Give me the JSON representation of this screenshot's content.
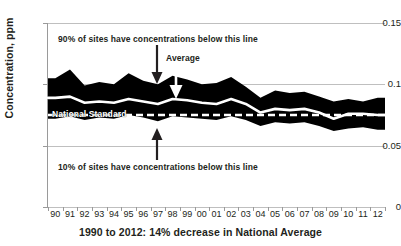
{
  "top_ghost_text": "",
  "chart_data": {
    "type": "area",
    "title": "",
    "xlabel": "1990 to 2012: 14% decrease in National Average",
    "ylabel": "Concentration, ppm",
    "ylim": [
      0,
      0.15
    ],
    "yticks": [
      "0",
      "0.05",
      "0.1",
      "0.15"
    ],
    "ytick_values": [
      0,
      0.05,
      0.1,
      0.15
    ],
    "grid": true,
    "legend": "none",
    "categories": [
      "90",
      "91",
      "92",
      "93",
      "94",
      "95",
      "96",
      "97",
      "98",
      "99",
      "00",
      "01",
      "02",
      "03",
      "04",
      "05",
      "06",
      "07",
      "08",
      "09",
      "10",
      "11",
      "12"
    ],
    "series": [
      {
        "name": "90th percentile",
        "label": "90% of sites have concentrations below this line",
        "color": "#000000",
        "values": [
          0.105,
          0.112,
          0.099,
          0.102,
          0.1,
          0.109,
          0.103,
          0.1,
          0.107,
          0.104,
          0.1,
          0.101,
          0.106,
          0.098,
          0.089,
          0.095,
          0.093,
          0.094,
          0.09,
          0.086,
          0.088,
          0.086,
          0.089
        ]
      },
      {
        "name": "Average",
        "label": "Average",
        "color": "#ffffff",
        "values": [
          0.089,
          0.09,
          0.085,
          0.086,
          0.085,
          0.088,
          0.086,
          0.084,
          0.088,
          0.087,
          0.085,
          0.084,
          0.088,
          0.084,
          0.077,
          0.08,
          0.079,
          0.08,
          0.077,
          0.072,
          0.076,
          0.076,
          0.075
        ]
      },
      {
        "name": "10th percentile",
        "label": "10% of sites have concentrations below this line",
        "color": "#000000",
        "values": [
          0.072,
          0.074,
          0.071,
          0.073,
          0.072,
          0.075,
          0.073,
          0.07,
          0.074,
          0.073,
          0.072,
          0.071,
          0.074,
          0.071,
          0.066,
          0.069,
          0.068,
          0.069,
          0.066,
          0.062,
          0.064,
          0.065,
          0.063
        ]
      }
    ],
    "reference_line": {
      "name": "National Standard",
      "label": "National Standard",
      "value": 0.075,
      "style": "dashed",
      "color": "#ffffff"
    },
    "annotations": [
      {
        "id": "p90-callout",
        "text": "90% of sites have concentrations below this line",
        "arrow": "down"
      },
      {
        "id": "average-callout",
        "text": "Average",
        "arrow": "down"
      },
      {
        "id": "p10-callout",
        "text": "10% of sites have concentrations below this line",
        "arrow": "up"
      },
      {
        "id": "standard-callout",
        "text": "National Standard",
        "arrow": "none"
      }
    ]
  }
}
